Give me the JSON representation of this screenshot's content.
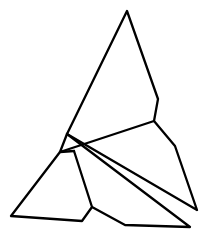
{
  "figure": {
    "width": 207,
    "height": 242,
    "background": "#ffffff",
    "stroke_color": "#000000",
    "stroke_width": 2.3,
    "vertices": {
      "A": [
        127,
        11
      ],
      "B": [
        158,
        99
      ],
      "C": [
        154,
        121
      ],
      "D": [
        175,
        146
      ],
      "E": [
        197,
        210
      ],
      "F": [
        67,
        134
      ],
      "G": [
        60,
        152
      ],
      "H": [
        74,
        151
      ],
      "I": [
        92,
        207
      ],
      "J": [
        82,
        221
      ],
      "K": [
        11,
        216
      ],
      "L": [
        125,
        225
      ],
      "M": [
        190,
        227
      ]
    },
    "polylines": [
      {
        "name": "outer-right-path",
        "points": [
          "F",
          "A",
          "B",
          "C",
          "D",
          "E",
          "F"
        ]
      },
      {
        "name": "cross-band",
        "points": [
          "G",
          "C"
        ]
      },
      {
        "name": "small-triangle",
        "points": [
          "F",
          "G",
          "H"
        ]
      },
      {
        "name": "lower-left-path",
        "points": [
          "G",
          "K",
          "J",
          "I",
          "H"
        ]
      },
      {
        "name": "lower-right-path",
        "points": [
          "I",
          "L",
          "M",
          "F"
        ]
      }
    ]
  }
}
